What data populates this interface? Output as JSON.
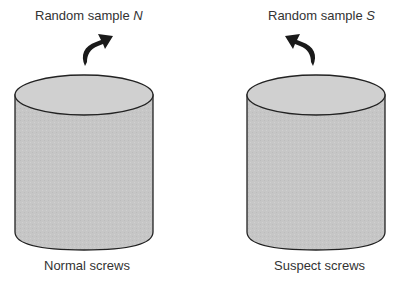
{
  "diagram": {
    "left": {
      "sample_prefix": "Random sample ",
      "sample_var": "N",
      "container_label": "Normal screws",
      "arrow_direction": "up-right"
    },
    "right": {
      "sample_prefix": "Random sample ",
      "sample_var": "S",
      "container_label": "Suspect screws",
      "arrow_direction": "up-left"
    },
    "colors": {
      "cylinder_fill": "#c4c4c4",
      "cylinder_top": "#cfcfcf",
      "outline": "#222222",
      "arrow": "#1a1a1a",
      "text": "#333333"
    }
  }
}
